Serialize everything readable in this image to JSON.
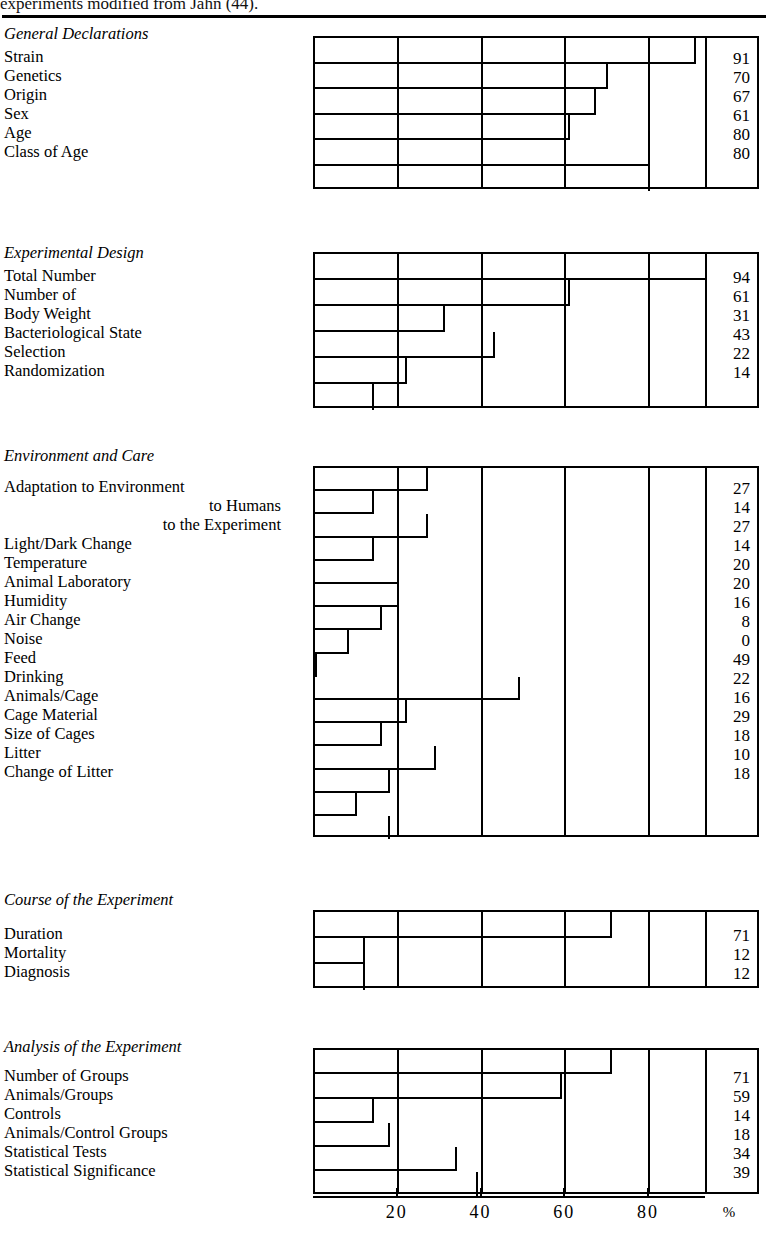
{
  "caption": {
    "text": "experiments modified from Jahn (44)."
  },
  "axis": {
    "ticks": [
      {
        "value": 20,
        "label": "20"
      },
      {
        "value": 40,
        "label": "40"
      },
      {
        "value": 60,
        "label": "60"
      },
      {
        "value": 80,
        "label": "80"
      }
    ],
    "unit_label": "%",
    "min": 0,
    "max": 100
  },
  "chart_data": {
    "type": "bar",
    "orientation": "horizontal",
    "title": "",
    "xlabel": "%",
    "ylabel": "",
    "xlim": [
      0,
      100
    ],
    "grid": true,
    "legend": "none",
    "groups": [
      {
        "name": "General Declarations",
        "categories": [
          "Strain",
          "Genetics",
          "Origin",
          "Sex",
          "Age",
          "Class of Age"
        ],
        "values": [
          91,
          70,
          67,
          61,
          80,
          80
        ]
      },
      {
        "name": "Experimental Design",
        "categories": [
          "Total Number",
          "Number of",
          "Body Weight",
          "Bacteriological State",
          "Selection",
          "Randomization"
        ],
        "values": [
          94,
          61,
          31,
          43,
          22,
          14
        ]
      },
      {
        "name": "Environment and Care",
        "categories": [
          "Adaptation to Environment",
          "to Humans",
          "to the Experiment",
          "Light/Dark Change",
          "Temperature",
          "Animal Laboratory",
          "Humidity",
          "Air Change",
          "Noise",
          "Feed",
          "Drinking",
          "Animals/Cage",
          "Cage Material",
          "Size of Cages",
          "Litter",
          "Change of Litter"
        ],
        "values": [
          27,
          14,
          27,
          14,
          20,
          20,
          16,
          8,
          0,
          49,
          22,
          16,
          29,
          18,
          10,
          18
        ]
      },
      {
        "name": "Course of the Experiment",
        "categories": [
          "Duration",
          "Mortality",
          "Diagnosis"
        ],
        "values": [
          71,
          12,
          12
        ]
      },
      {
        "name": "Analysis of the Experiment",
        "categories": [
          "Number of Groups",
          "Animals/Groups",
          "Controls",
          "Animals/Control Groups",
          "Statistical Tests",
          "Statistical Significance"
        ],
        "values": [
          71,
          59,
          14,
          18,
          34,
          39
        ]
      }
    ]
  },
  "sections": [
    {
      "title": "General Declarations",
      "rows": [
        {
          "label": "Strain",
          "value": 91,
          "value_text": "91",
          "indent": false
        },
        {
          "label": "Genetics",
          "value": 70,
          "value_text": "70",
          "indent": false
        },
        {
          "label": "Origin",
          "value": 67,
          "value_text": "67",
          "indent": false
        },
        {
          "label": "Sex",
          "value": 61,
          "value_text": "61",
          "indent": false
        },
        {
          "label": "Age",
          "value": 80,
          "value_text": "80",
          "indent": false
        },
        {
          "label": "Class of Age",
          "value": 80,
          "value_text": "80",
          "indent": false
        }
      ]
    },
    {
      "title": "Experimental Design",
      "rows": [
        {
          "label": "Total Number",
          "value": 94,
          "value_text": "94",
          "indent": false
        },
        {
          "label": "Number of",
          "value": 61,
          "value_text": "61",
          "indent": false
        },
        {
          "label": "Body Weight",
          "value": 31,
          "value_text": "31",
          "indent": false
        },
        {
          "label": "Bacteriological State",
          "value": 43,
          "value_text": "43",
          "indent": false
        },
        {
          "label": "Selection",
          "value": 22,
          "value_text": "22",
          "indent": false
        },
        {
          "label": "Randomization",
          "value": 14,
          "value_text": "14",
          "indent": false
        }
      ]
    },
    {
      "title": "Environment and Care",
      "rows": [
        {
          "label": "Adaptation to Environment",
          "value": 27,
          "value_text": "27",
          "indent": false
        },
        {
          "label": "to Humans",
          "value": 14,
          "value_text": "14",
          "indent": true
        },
        {
          "label": "to the Experiment",
          "value": 27,
          "value_text": "27",
          "indent": true
        },
        {
          "label": "Light/Dark Change",
          "value": 14,
          "value_text": "14",
          "indent": false
        },
        {
          "label": "Temperature",
          "value": 20,
          "value_text": "20",
          "indent": false
        },
        {
          "label": "Animal Laboratory",
          "value": 20,
          "value_text": "20",
          "indent": false
        },
        {
          "label": "Humidity",
          "value": 16,
          "value_text": "16",
          "indent": false
        },
        {
          "label": "Air Change",
          "value": 8,
          "value_text": "8",
          "indent": false
        },
        {
          "label": "Noise",
          "value": 0,
          "value_text": "0",
          "indent": false
        },
        {
          "label": "Feed",
          "value": 49,
          "value_text": "49",
          "indent": false
        },
        {
          "label": "Drinking",
          "value": 22,
          "value_text": "22",
          "indent": false
        },
        {
          "label": "Animals/Cage",
          "value": 16,
          "value_text": "16",
          "indent": false
        },
        {
          "label": "Cage Material",
          "value": 29,
          "value_text": "29",
          "indent": false
        },
        {
          "label": "Size of Cages",
          "value": 18,
          "value_text": "18",
          "indent": false
        },
        {
          "label": "Litter",
          "value": 10,
          "value_text": "10",
          "indent": false
        },
        {
          "label": "Change of Litter",
          "value": 18,
          "value_text": "18",
          "indent": false
        }
      ]
    },
    {
      "title": "Course of the Experiment",
      "rows": [
        {
          "label": "Duration",
          "value": 71,
          "value_text": "71",
          "indent": false
        },
        {
          "label": "Mortality",
          "value": 12,
          "value_text": "12",
          "indent": false
        },
        {
          "label": "Diagnosis",
          "value": 12,
          "value_text": "12",
          "indent": false
        }
      ]
    },
    {
      "title": "Analysis of the Experiment",
      "rows": [
        {
          "label": "Number of Groups",
          "value": 71,
          "value_text": "71",
          "indent": false
        },
        {
          "label": "Animals/Groups",
          "value": 59,
          "value_text": "59",
          "indent": false
        },
        {
          "label": "Controls",
          "value": 14,
          "value_text": "14",
          "indent": false
        },
        {
          "label": "Animals/Control Groups",
          "value": 18,
          "value_text": "18",
          "indent": false
        },
        {
          "label": "Statistical Tests",
          "value": 34,
          "value_text": "34",
          "indent": false
        },
        {
          "label": "Statistical Significance",
          "value": 39,
          "value_text": "39",
          "indent": false
        }
      ]
    }
  ]
}
